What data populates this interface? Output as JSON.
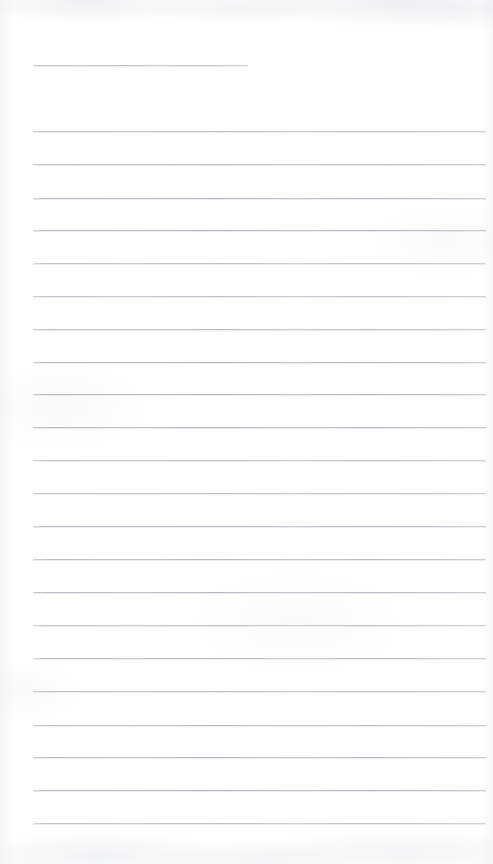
{
  "document": {
    "kind": "scanned-ruled-paper",
    "title": "Blank Lined Notebook Page",
    "orientation": "portrait",
    "width_px": 493,
    "height_px": 864,
    "has_text_content": false,
    "has_handwriting": false,
    "background_color": "#fefefe",
    "rule_color": "#b5b9c2",
    "paper_texture": "faint grayscale scan mottling at top and bottom edges"
  },
  "ruling": {
    "rule_count": 25,
    "rule_thickness_px": 1,
    "left_margin_px": 33,
    "right_edge_px": 486,
    "line_spacing_px": 32.7,
    "first_rule_is_short": true,
    "short_rule_right_edge_px": 248,
    "top_rule_y_px": 65,
    "bottom_rule_y_px": 823,
    "has_vertical_margin_rule": false,
    "has_holes_or_binding": false,
    "lines": [
      {
        "index": 1,
        "y": 65,
        "x_start": 33,
        "x_end": 248,
        "full_width": false
      },
      {
        "index": 2,
        "y": 131,
        "x_start": 33,
        "x_end": 486,
        "full_width": true
      },
      {
        "index": 3,
        "y": 164,
        "x_start": 33,
        "x_end": 486,
        "full_width": true
      },
      {
        "index": 4,
        "y": 198,
        "x_start": 33,
        "x_end": 486,
        "full_width": true
      },
      {
        "index": 5,
        "y": 230,
        "x_start": 33,
        "x_end": 486,
        "full_width": true
      },
      {
        "index": 6,
        "y": 263,
        "x_start": 33,
        "x_end": 486,
        "full_width": true
      },
      {
        "index": 7,
        "y": 296,
        "x_start": 33,
        "x_end": 486,
        "full_width": true
      },
      {
        "index": 8,
        "y": 329,
        "x_start": 33,
        "x_end": 486,
        "full_width": true
      },
      {
        "index": 9,
        "y": 362,
        "x_start": 33,
        "x_end": 486,
        "full_width": true
      },
      {
        "index": 10,
        "y": 394,
        "x_start": 33,
        "x_end": 486,
        "full_width": true
      },
      {
        "index": 11,
        "y": 427,
        "x_start": 33,
        "x_end": 486,
        "full_width": true
      },
      {
        "index": 12,
        "y": 460,
        "x_start": 33,
        "x_end": 486,
        "full_width": true
      },
      {
        "index": 13,
        "y": 493,
        "x_start": 33,
        "x_end": 486,
        "full_width": true
      },
      {
        "index": 14,
        "y": 526,
        "x_start": 33,
        "x_end": 486,
        "full_width": true
      },
      {
        "index": 15,
        "y": 559,
        "x_start": 33,
        "x_end": 486,
        "full_width": true
      },
      {
        "index": 16,
        "y": 592,
        "x_start": 33,
        "x_end": 486,
        "full_width": true
      },
      {
        "index": 17,
        "y": 625,
        "x_start": 33,
        "x_end": 486,
        "full_width": true
      },
      {
        "index": 18,
        "y": 658,
        "x_start": 33,
        "x_end": 486,
        "full_width": true
      },
      {
        "index": 19,
        "y": 691,
        "x_start": 33,
        "x_end": 486,
        "full_width": true
      },
      {
        "index": 20,
        "y": 725,
        "x_start": 33,
        "x_end": 486,
        "full_width": true
      },
      {
        "index": 21,
        "y": 757,
        "x_start": 33,
        "x_end": 486,
        "full_width": true
      },
      {
        "index": 22,
        "y": 790,
        "x_start": 33,
        "x_end": 486,
        "full_width": true
      },
      {
        "index": 23,
        "y": 823,
        "x_start": 33,
        "x_end": 486,
        "full_width": true
      }
    ]
  }
}
